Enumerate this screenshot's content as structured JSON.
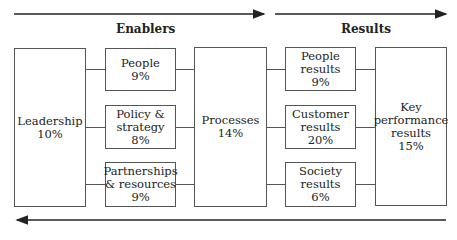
{
  "headings": {
    "enablers": "Enablers",
    "results": "Results"
  },
  "boxes": {
    "leadership": {
      "label": "Leadership\n10%"
    },
    "people": {
      "label": "People\n9%"
    },
    "policy_strategy": {
      "label": "Policy &\nstrategy\n8%"
    },
    "partnerships_resources": {
      "label": "Partnerships\n& resources\n9%"
    },
    "processes": {
      "label": "Processes\n14%"
    },
    "people_results": {
      "label": "People\nresults\n9%"
    },
    "customer_results": {
      "label": "Customer\nresults\n20%"
    },
    "society_results": {
      "label": "Society\nresults\n6%"
    },
    "key_performance_results": {
      "label": "Key\nperformance\nresults\n15%"
    }
  },
  "arrows": {
    "enablers_arrow": "right",
    "results_arrow": "right",
    "feedback_arrow": "left"
  },
  "colors": {
    "line": "#555555",
    "arrow": "#222222"
  }
}
